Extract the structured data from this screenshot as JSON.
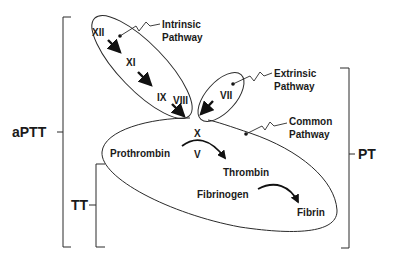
{
  "diagram": {
    "tests": {
      "aptt": "aPTT",
      "pt": "PT",
      "tt": "TT"
    },
    "pathways": {
      "intrinsic": {
        "line1": "Intrinsic",
        "line2": "Pathway"
      },
      "extrinsic": {
        "line1": "Extrinsic",
        "line2": "Pathway"
      },
      "common": {
        "line1": "Common",
        "line2": "Pathway"
      }
    },
    "factors": {
      "xii": "XII",
      "xi": "XI",
      "ix": "IX",
      "viii": "VIII",
      "vii": "VII",
      "x": "X",
      "v": "V"
    },
    "products": {
      "prothrombin": "Prothrombin",
      "thrombin": "Thrombin",
      "fibrinogen": "Fibrinogen",
      "fibrin": "Fibrin"
    },
    "colors": {
      "line": "#2a2a2a",
      "text": "#1a1a1a",
      "background": "#ffffff"
    }
  }
}
